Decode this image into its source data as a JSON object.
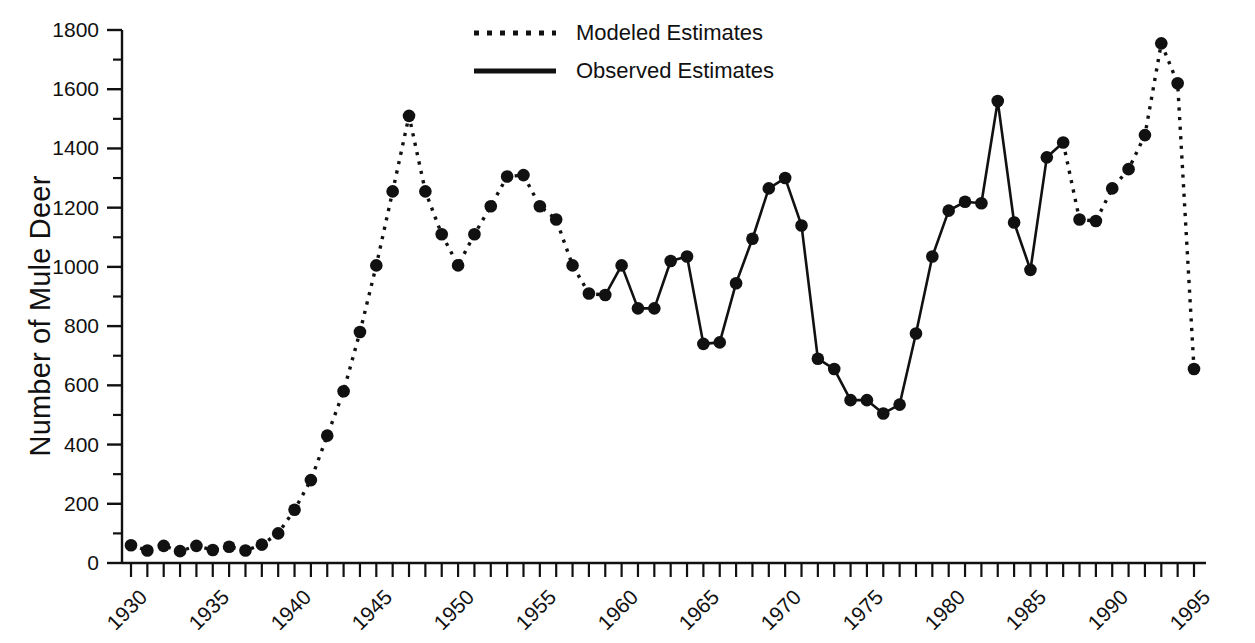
{
  "chart_data": {
    "type": "line",
    "title": "",
    "xlabel": "",
    "ylabel": "Number of Mule Deer",
    "xlim": [
      1930,
      1995
    ],
    "ylim": [
      0,
      1800
    ],
    "grid": false,
    "legend_position": "top-center",
    "y_ticks_major": [
      0,
      200,
      400,
      600,
      800,
      1000,
      1200,
      1400,
      1600,
      1800
    ],
    "y_ticks_minor_step": 100,
    "x_ticks_major": [
      1930,
      1935,
      1940,
      1945,
      1950,
      1955,
      1960,
      1965,
      1970,
      1975,
      1980,
      1985,
      1990,
      1995
    ],
    "x_ticks_minor_step": 1,
    "x_tick_labels": [
      "1930",
      "1935",
      "1940",
      "1945",
      "1950",
      "1955",
      "1960",
      "1965",
      "1970",
      "1975",
      "1980",
      "1985",
      "1990",
      "1995"
    ],
    "y_tick_labels": [
      "0",
      "200",
      "400",
      "600",
      "800",
      "1000",
      "1200",
      "1400",
      "1600",
      "1800"
    ],
    "marker": "filled-circle",
    "marker_color": "#111111",
    "x": [
      1930,
      1931,
      1932,
      1933,
      1934,
      1935,
      1936,
      1937,
      1938,
      1939,
      1940,
      1941,
      1942,
      1943,
      1944,
      1945,
      1946,
      1947,
      1948,
      1949,
      1950,
      1951,
      1952,
      1953,
      1954,
      1955,
      1956,
      1957,
      1958,
      1959,
      1960,
      1961,
      1962,
      1963,
      1964,
      1965,
      1966,
      1967,
      1968,
      1969,
      1970,
      1971,
      1972,
      1973,
      1974,
      1975,
      1976,
      1977,
      1978,
      1979,
      1980,
      1981,
      1982,
      1983,
      1984,
      1985,
      1986,
      1987,
      1988,
      1989,
      1990,
      1991,
      1992,
      1993,
      1994,
      1995
    ],
    "values": [
      60,
      42,
      58,
      40,
      58,
      44,
      55,
      42,
      62,
      100,
      180,
      280,
      430,
      580,
      780,
      1005,
      1255,
      1510,
      1255,
      1110,
      1005,
      1110,
      1205,
      1305,
      1310,
      1205,
      1160,
      1005,
      910,
      905,
      1005,
      860,
      860,
      1020,
      1035,
      740,
      745,
      945,
      1095,
      1265,
      1300,
      1140,
      690,
      655,
      550,
      550,
      505,
      535,
      775,
      1035,
      1190,
      1220,
      1215,
      1560,
      1150,
      990,
      1370,
      1420,
      1160,
      1155,
      1265,
      1330,
      1445,
      1755,
      1620,
      655
    ],
    "series": [
      {
        "name": "Modeled Estimates",
        "style": "dotted",
        "segments": [
          {
            "x_start": 1930,
            "x_end": 1959
          },
          {
            "x_start": 1987,
            "x_end": 1995
          }
        ]
      },
      {
        "name": "Observed Estimates",
        "style": "solid",
        "segments": [
          {
            "x_start": 1959,
            "x_end": 1987
          }
        ]
      }
    ],
    "legend": [
      {
        "label": "Modeled Estimates",
        "style": "dotted",
        "icon": "dotted-line-swatch"
      },
      {
        "label": "Observed Estimates",
        "style": "solid",
        "icon": "solid-line-swatch"
      }
    ],
    "colors": {
      "line": "#111111",
      "axis": "#111111",
      "background": "#ffffff",
      "text": "#111111"
    }
  }
}
